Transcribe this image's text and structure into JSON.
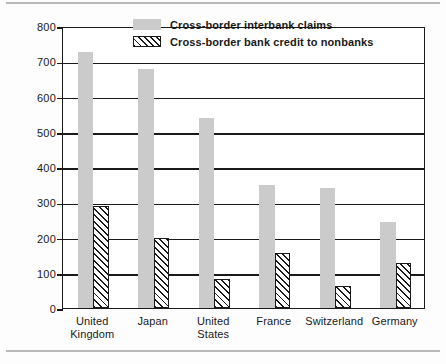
{
  "chart_data": {
    "type": "bar",
    "title": "",
    "xlabel": "",
    "ylabel": "Billions of U.S. dollars",
    "ylim": [
      0,
      800
    ],
    "ytick_labels": [
      "800",
      "700",
      "600",
      "500",
      "400",
      "300",
      "200",
      "100",
      "0"
    ],
    "yticks": [
      800,
      700,
      600,
      500,
      400,
      300,
      200,
      100,
      0
    ],
    "grid": true,
    "legend_position": "top-center",
    "categories": [
      "United\nKingdom",
      "Japan",
      "United\nStates",
      "France",
      "Switzerland",
      "Germany"
    ],
    "series": [
      {
        "name": "Cross-border interbank claims",
        "color": "#cbcbcb",
        "pattern": "solid",
        "values": [
          725,
          677,
          538,
          350,
          340,
          245
        ]
      },
      {
        "name": "Cross-border bank credit to nonbanks",
        "color": "#ffffff",
        "pattern": "diagonal-hatch",
        "values": [
          290,
          200,
          83,
          155,
          63,
          128
        ]
      }
    ]
  },
  "legend": {
    "items": [
      {
        "label": "Cross-border interbank claims",
        "swatch": "solid"
      },
      {
        "label": "Cross-border bank credit to nonbanks",
        "swatch": "hatch"
      }
    ]
  }
}
